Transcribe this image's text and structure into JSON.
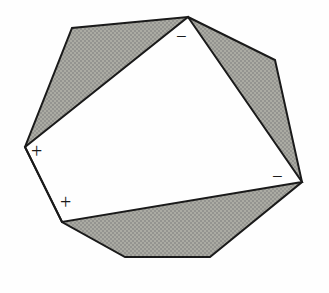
{
  "figure": {
    "background_color": "#fefefe",
    "shade_color": "#a9a9a1",
    "shade_dot_color": "#8d8d85",
    "stroke_color": "#1a1a1a",
    "stroke_width": 2,
    "outer_polygon": {
      "name": "heptagon-outline",
      "points": "188,17 275,60 302,182 210,257 125,257 62,222 25,147 72,28"
    },
    "inner_polygon": {
      "name": "inner-quadrilateral",
      "points": "188,17 302,182 62,222 25,147"
    },
    "shaded_regions": [
      {
        "name": "shaded-region-top-left",
        "points": "188,17 25,147 72,28"
      },
      {
        "name": "shaded-region-right",
        "points": "188,17 275,60 302,182"
      },
      {
        "name": "shaded-region-bottom",
        "points": "302,182 210,257 125,257 62,222"
      }
    ],
    "labels": [
      {
        "name": "sign-minus-top",
        "text": "−",
        "x": 176,
        "y": 27,
        "size": 19
      },
      {
        "name": "sign-minus-right",
        "text": "−",
        "x": 272,
        "y": 167,
        "size": 19
      },
      {
        "name": "sign-plus-left",
        "text": "+",
        "x": 31,
        "y": 141,
        "size": 20
      },
      {
        "name": "sign-plus-lower-left",
        "text": "+",
        "x": 60,
        "y": 192,
        "size": 20
      }
    ]
  }
}
